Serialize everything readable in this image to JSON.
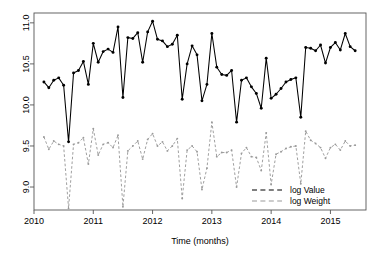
{
  "chart_data": {
    "type": "line",
    "title": "",
    "xlabel": "Time (months)",
    "ylabel": "",
    "xlim": [
      2010.0,
      2015.6
    ],
    "ylim": [
      8.72,
      11.12
    ],
    "grid": false,
    "legend_position": "bottom-right",
    "x_ticks": [
      {
        "value": 2010,
        "label": "2010"
      },
      {
        "value": 2011,
        "label": "2011"
      },
      {
        "value": 2012,
        "label": "2012"
      },
      {
        "value": 2013,
        "label": "2013"
      },
      {
        "value": 2014,
        "label": "2014"
      },
      {
        "value": 2015,
        "label": "2015"
      }
    ],
    "y_ticks": [
      {
        "value": 9.0,
        "label": "9.0"
      },
      {
        "value": 9.5,
        "label": "9.5"
      },
      {
        "value": 10.0,
        "label": "10.0"
      },
      {
        "value": 10.5,
        "label": "10.5"
      },
      {
        "value": 11.0,
        "label": "11.0"
      }
    ],
    "x": [
      2010.167,
      2010.25,
      2010.333,
      2010.417,
      2010.5,
      2010.583,
      2010.667,
      2010.75,
      2010.833,
      2010.917,
      2011.0,
      2011.083,
      2011.167,
      2011.25,
      2011.333,
      2011.417,
      2011.5,
      2011.583,
      2011.667,
      2011.75,
      2011.833,
      2011.917,
      2012.0,
      2012.083,
      2012.167,
      2012.25,
      2012.333,
      2012.417,
      2012.5,
      2012.583,
      2012.667,
      2012.75,
      2012.833,
      2012.917,
      2013.0,
      2013.083,
      2013.167,
      2013.25,
      2013.333,
      2013.417,
      2013.5,
      2013.583,
      2013.667,
      2013.75,
      2013.833,
      2013.917,
      2014.0,
      2014.083,
      2014.167,
      2014.25,
      2014.333,
      2014.417,
      2014.5,
      2014.583,
      2014.667,
      2014.75,
      2014.833,
      2014.917,
      2015.0,
      2015.083,
      2015.167,
      2015.25,
      2015.333,
      2015.417
    ],
    "series": [
      {
        "name": "log Value",
        "color": "#000000",
        "style": "solid-with-points",
        "values": [
          10.28,
          10.21,
          10.3,
          10.33,
          10.24,
          9.55,
          10.39,
          10.42,
          10.53,
          10.25,
          10.75,
          10.52,
          10.65,
          10.68,
          10.64,
          10.95,
          10.09,
          10.82,
          10.81,
          10.88,
          10.52,
          10.89,
          11.02,
          10.8,
          10.78,
          10.71,
          10.74,
          10.85,
          10.07,
          10.5,
          10.72,
          10.61,
          10.05,
          10.25,
          10.87,
          10.46,
          10.37,
          10.36,
          10.42,
          9.79,
          10.3,
          10.33,
          10.22,
          10.14,
          9.96,
          10.57,
          10.08,
          10.13,
          10.2,
          10.28,
          10.31,
          10.33,
          9.85,
          10.7,
          10.69,
          10.66,
          10.73,
          10.51,
          10.7,
          10.76,
          10.67,
          10.87,
          10.71,
          10.66
        ]
      },
      {
        "name": "log Weight",
        "color": "#9a9a9a",
        "style": "dashed-with-points",
        "values": [
          9.61,
          9.46,
          9.56,
          9.52,
          9.5,
          8.74,
          9.52,
          9.54,
          9.6,
          9.28,
          9.71,
          9.39,
          9.52,
          9.54,
          9.48,
          9.63,
          8.76,
          9.44,
          9.5,
          9.56,
          9.34,
          9.58,
          9.65,
          9.5,
          9.55,
          9.44,
          9.5,
          9.59,
          8.86,
          9.45,
          9.5,
          9.43,
          8.97,
          9.23,
          9.79,
          9.37,
          9.42,
          9.42,
          9.45,
          9.0,
          9.41,
          9.48,
          9.37,
          9.36,
          9.2,
          9.66,
          9.03,
          9.4,
          9.43,
          9.47,
          9.49,
          9.5,
          9.04,
          9.68,
          9.57,
          9.53,
          9.48,
          9.35,
          9.48,
          9.52,
          9.45,
          9.56,
          9.5,
          9.51
        ]
      }
    ],
    "legend": [
      {
        "label": "log Value",
        "color": "#000000"
      },
      {
        "label": "log Weight",
        "color": "#9a9a9a"
      }
    ]
  }
}
